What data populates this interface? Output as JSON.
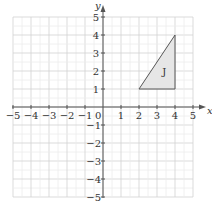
{
  "axes": {
    "x_label": "x",
    "y_label": "y",
    "origin_label": "0",
    "x_ticks": [
      "−5",
      "−4",
      "−3",
      "−2",
      "−1",
      "1",
      "2",
      "3",
      "4",
      "5"
    ],
    "y_ticks_pos": [
      "1",
      "2",
      "3",
      "4",
      "5"
    ],
    "y_ticks_neg": [
      "−1",
      "−2",
      "−3",
      "−4",
      "−5"
    ],
    "range": [
      -5,
      5
    ]
  },
  "shape": {
    "label": "J",
    "vertices": [
      [
        2,
        1
      ],
      [
        4,
        1
      ],
      [
        4,
        4
      ]
    ],
    "fill": "#e6e6e6",
    "stroke": "#555555"
  },
  "colors": {
    "grid": "#dcdcdc",
    "axis": "#555555"
  }
}
